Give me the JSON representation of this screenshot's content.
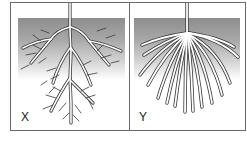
{
  "figure": {
    "panels": [
      {
        "id": "X",
        "label": "X",
        "type": "taproot system"
      },
      {
        "id": "Y",
        "label": "Y",
        "type": "fibrous root system"
      }
    ]
  },
  "colors": {
    "soil_top": "#8d8d8d",
    "soil_bottom": "#ffffff",
    "border": "#6a6a6a",
    "root_outline": "#3a3a3a"
  }
}
